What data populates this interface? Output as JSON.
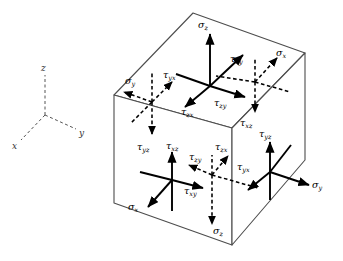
{
  "figure": {
    "type": "stress-cube-diagram",
    "background_color": "#ffffff",
    "line_color": "#000000",
    "edge_color": "#4d4d4d",
    "stroke_solid": "solid",
    "stroke_hidden": "dashed"
  },
  "axes": {
    "name": "coordinate-triad",
    "origin": [
      45,
      115
    ],
    "labels": {
      "x": "x",
      "y": "y",
      "z": "z"
    },
    "style": "dashed",
    "directions": {
      "z": "up",
      "y": "right-down",
      "x": "left-down"
    }
  },
  "cube": {
    "name": "stress-element-cube",
    "vertices": {
      "top_left": [
        114,
        95
      ],
      "top_back": [
        193,
        13
      ],
      "top_right": [
        305,
        53
      ],
      "top_front": [
        232,
        128
      ],
      "bottom_left": [
        114,
        203
      ],
      "bottom_front": [
        232,
        245
      ],
      "bottom_right": [
        305,
        160
      ],
      "bottom_back": [
        193,
        121
      ]
    },
    "visible_faces": [
      "top",
      "left-front",
      "right-front"
    ],
    "hidden_faces": [
      "bottom",
      "left-back",
      "right-back"
    ]
  },
  "faces": [
    {
      "id": "top-face",
      "name": "top-face-stresses",
      "normal": "+z",
      "hidden": false,
      "origin": [
        210,
        86
      ],
      "arrows": [
        {
          "label": "sigma_z",
          "sym": "σ",
          "sub": "z",
          "dir": "up",
          "style": "solid",
          "label_pos": [
            200,
            26
          ]
        },
        {
          "label": "tau_zx",
          "sym": "τ",
          "sub": "zx",
          "dir": "down-left",
          "style": "solid",
          "label_pos": [
            186,
            108
          ]
        },
        {
          "label": "tau_zy",
          "sym": "τ",
          "sub": "zy",
          "dir": "down-right",
          "style": "solid",
          "label_pos": [
            219,
            101
          ]
        },
        {
          "label": "tau_xy",
          "sym": "τ",
          "sub": "xy",
          "dir": "up-right",
          "style": "solid",
          "label_pos": [
            236,
            63
          ]
        }
      ]
    },
    {
      "id": "back-left-face",
      "name": "back-left-face-stresses",
      "normal": "-y",
      "hidden": true,
      "origin": [
        152,
        102
      ],
      "arrows": [
        {
          "label": "sigma_y",
          "sym": "σ",
          "sub": "y",
          "dir": "left-down",
          "style": "dashed",
          "label_pos": [
            130,
            79
          ]
        },
        {
          "label": "tau_yx",
          "sym": "τ",
          "sub": "yx",
          "dir": "up-right",
          "style": "dashed",
          "label_pos": [
            168,
            73
          ]
        },
        {
          "label": "tau_yz",
          "sym": "τ",
          "sub": "yz",
          "dir": "down",
          "style": "dashed",
          "label_pos": [
            146,
            142
          ]
        }
      ]
    },
    {
      "id": "back-right-face",
      "name": "back-right-face-stresses",
      "normal": "+x",
      "hidden": true,
      "origin": [
        255,
        82
      ],
      "arrows": [
        {
          "label": "sigma_x",
          "sym": "σ",
          "sub": "x",
          "dir": "up-right",
          "style": "dashed",
          "label_pos": [
            279,
            55
          ]
        },
        {
          "label": "tau_xz",
          "sym": "τ",
          "sub": "xz",
          "dir": "down",
          "style": "dashed",
          "label_pos": [
            245,
            115
          ]
        }
      ]
    },
    {
      "id": "front-left-face",
      "name": "front-left-face-stresses",
      "normal": "-x",
      "hidden": false,
      "origin": [
        172,
        180
      ],
      "arrows": [
        {
          "label": "tau_xz",
          "sym": "τ",
          "sub": "xz",
          "dir": "up",
          "style": "solid",
          "label_pos": [
            172,
            145
          ]
        },
        {
          "label": "tau_xy",
          "sym": "τ",
          "sub": "xy",
          "dir": "right",
          "style": "solid",
          "label_pos": [
            190,
            186
          ]
        },
        {
          "label": "sigma_x",
          "sym": "σ",
          "sub": "x",
          "dir": "down-left",
          "style": "solid",
          "label_pos": [
            138,
            202
          ]
        }
      ]
    },
    {
      "id": "bottom-face",
      "name": "bottom-face-stresses",
      "normal": "-z",
      "hidden": true,
      "origin": [
        212,
        175
      ],
      "arrows": [
        {
          "label": "sigma_z",
          "sym": "σ",
          "sub": "z",
          "dir": "down",
          "style": "dashed",
          "label_pos": [
            216,
            228
          ]
        },
        {
          "label": "tau_zy",
          "sym": "τ",
          "sub": "zy",
          "dir": "up-left",
          "style": "dashed",
          "label_pos": [
            196,
            155
          ]
        },
        {
          "label": "tau_zx",
          "sym": "τ",
          "sub": "zx",
          "dir": "up-right",
          "style": "dashed",
          "label_pos": [
            222,
            150
          ]
        }
      ]
    },
    {
      "id": "front-right-face",
      "name": "front-right-face-stresses",
      "normal": "+y",
      "hidden": false,
      "origin": [
        270,
        172
      ],
      "arrows": [
        {
          "label": "tau_yz",
          "sym": "τ",
          "sub": "yz",
          "dir": "up",
          "style": "solid",
          "label_pos": [
            266,
            132
          ]
        },
        {
          "label": "tau_yx",
          "sym": "τ",
          "sub": "yx",
          "dir": "down-left",
          "style": "solid",
          "label_pos": [
            245,
            165
          ]
        },
        {
          "label": "sigma_y",
          "sym": "σ",
          "sub": "y",
          "dir": "right-down",
          "style": "solid",
          "label_pos": [
            316,
            182
          ]
        }
      ]
    }
  ],
  "label_text": {
    "sigma_z": "σz",
    "sigma_x": "σx",
    "sigma_y": "σy",
    "tau_zx": "τzx",
    "tau_zy": "τzy",
    "tau_xy": "τxy",
    "tau_xz": "τxz",
    "tau_yx": "τyx",
    "tau_yz": "τyz",
    "axis_x": "x",
    "axis_y": "y",
    "axis_z": "z"
  }
}
